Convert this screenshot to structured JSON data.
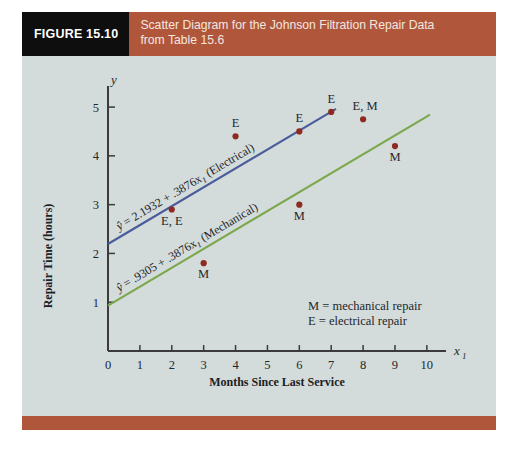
{
  "figure": {
    "tag": "FIGURE 15.10",
    "caption_line1": "Scatter Diagram for the Johnson Filtration Repair Data",
    "caption_line2": "from Table 15.6",
    "tag_background": "#0e0e0e",
    "band_background": "#b0563a",
    "panel_background": "#d3dbdb"
  },
  "chart_data": {
    "type": "scatter",
    "title": "Scatter Diagram for the Johnson Filtration Repair Data from Table 15.6",
    "xlabel": "Months Since Last Service",
    "ylabel": "Repair Time (hours)",
    "x_axis_symbol": "x",
    "x_axis_subscript": "1",
    "y_axis_symbol": "y",
    "xlim": [
      0,
      10.6
    ],
    "ylim": [
      0,
      5.35
    ],
    "xticks": [
      0,
      1,
      2,
      3,
      4,
      5,
      6,
      7,
      8,
      9,
      10
    ],
    "yticks": [
      1,
      2,
      3,
      4,
      5
    ],
    "grid": false,
    "point_color": "#8e2b20",
    "series": [
      {
        "name": "electrical repair",
        "code": "E",
        "points": [
          {
            "x": 2,
            "y": 2.9,
            "label": "E, E"
          },
          {
            "x": 4,
            "y": 4.4,
            "label": "E"
          },
          {
            "x": 6,
            "y": 4.5,
            "label": "E"
          },
          {
            "x": 7,
            "y": 4.9,
            "label": "E"
          }
        ]
      },
      {
        "name": "mechanical repair",
        "code": "M",
        "points": [
          {
            "x": 3,
            "y": 1.8,
            "label": "M"
          },
          {
            "x": 6,
            "y": 3.0,
            "label": "M"
          },
          {
            "x": 9,
            "y": 4.2,
            "label": "M"
          }
        ]
      },
      {
        "name": "electrical and mechanical overlap",
        "code": "E, M",
        "points": [
          {
            "x": 8,
            "y": 4.75,
            "label": "E, M"
          }
        ]
      }
    ],
    "lines": [
      {
        "name": "electrical-regression-line",
        "color": "#4a5c9b",
        "intercept": 2.1932,
        "slope": 0.3876,
        "x_start": 0,
        "x_end": 7.15,
        "equation_prefix": "y",
        "equation_body": " = 2.1932 + .3876x",
        "equation_subscript": "1",
        "equation_suffix": " (Electrical)"
      },
      {
        "name": "mechanical-regression-line",
        "color": "#7ba84c",
        "intercept": 0.9305,
        "slope": 0.3876,
        "x_start": 0,
        "x_end": 10.1,
        "equation_prefix": "y",
        "equation_body": " = .9305 + .3876x",
        "equation_subscript": "1",
        "equation_suffix": " (Mechanical)"
      }
    ],
    "legend": {
      "position": "bottom-right",
      "entries": [
        "M = mechanical repair",
        "E = electrical repair"
      ]
    }
  }
}
